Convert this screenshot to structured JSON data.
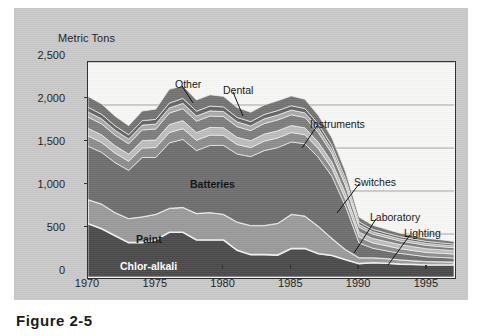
{
  "figure": {
    "caption": "Figure 2-5",
    "axis_title": "Metric Tons"
  },
  "chart_data": {
    "type": "area",
    "title": "",
    "subtitle": "",
    "xlabel": "",
    "ylabel": "Metric Tons",
    "ylim": [
      0,
      2500
    ],
    "xlim": [
      1970,
      1997
    ],
    "grid": true,
    "legend_position": "inline-annotations",
    "ytick_labels": [
      "2,500",
      "2,000",
      "1,500",
      "1,000",
      "500",
      "0"
    ],
    "ytick_values": [
      2500,
      2000,
      1500,
      1000,
      500,
      0
    ],
    "xtick_labels": [
      "1970",
      "1975",
      "1980",
      "1985",
      "1990",
      "1995"
    ],
    "xtick_values": [
      1970,
      1975,
      1980,
      1985,
      1990,
      1995
    ],
    "x": [
      1970,
      1971,
      1972,
      1973,
      1974,
      1975,
      1976,
      1977,
      1978,
      1979,
      1980,
      1981,
      1982,
      1983,
      1984,
      1985,
      1986,
      1987,
      1988,
      1989,
      1990,
      1991,
      1992,
      1993,
      1994,
      1995,
      1996,
      1997
    ],
    "stack_order_bottom_to_top": [
      "Chlor-alkali",
      "Paint",
      "Batteries",
      "Instruments",
      "Dental",
      "Switches",
      "Laboratory",
      "Lighting",
      "Other"
    ],
    "series": [
      {
        "name": "Chlor-alkali",
        "color": "#4a4a4a",
        "values": [
          620,
          560,
          480,
          400,
          400,
          430,
          520,
          520,
          430,
          430,
          430,
          310,
          260,
          260,
          255,
          330,
          330,
          270,
          250,
          200,
          155,
          165,
          160,
          150,
          145,
          140,
          140,
          140
        ]
      },
      {
        "name": "Paint",
        "color": "#9a9a9a",
        "values": [
          280,
          290,
          270,
          280,
          300,
          300,
          280,
          290,
          310,
          320,
          300,
          330,
          340,
          340,
          370,
          400,
          380,
          320,
          200,
          120,
          70,
          60,
          55,
          50,
          45,
          40,
          38,
          35
        ]
      },
      {
        "name": "Batteries",
        "color": "#6e6e6e",
        "values": [
          620,
          600,
          580,
          560,
          690,
          660,
          760,
          790,
          730,
          780,
          800,
          790,
          800,
          870,
          880,
          840,
          840,
          800,
          720,
          500,
          170,
          110,
          90,
          75,
          65,
          55,
          50,
          45
        ]
      },
      {
        "name": "Instruments",
        "color": "#8c8c8c",
        "values": [
          120,
          115,
          110,
          105,
          110,
          115,
          120,
          125,
          120,
          120,
          118,
          110,
          105,
          110,
          112,
          110,
          105,
          100,
          92,
          85,
          70,
          62,
          58,
          55,
          52,
          50,
          48,
          46
        ]
      },
      {
        "name": "Dental",
        "color": "#bcbcbc",
        "values": [
          90,
          88,
          86,
          84,
          86,
          88,
          92,
          94,
          90,
          90,
          88,
          84,
          80,
          82,
          84,
          82,
          80,
          76,
          72,
          66,
          56,
          52,
          50,
          48,
          46,
          44,
          42,
          40
        ]
      },
      {
        "name": "Switches",
        "color": "#7d7d7d",
        "values": [
          130,
          128,
          124,
          120,
          124,
          128,
          134,
          138,
          132,
          132,
          130,
          124,
          118,
          122,
          126,
          124,
          120,
          112,
          100,
          88,
          58,
          50,
          46,
          42,
          40,
          38,
          36,
          34
        ]
      },
      {
        "name": "Laboratory",
        "color": "#a8a8a8",
        "values": [
          60,
          58,
          56,
          55,
          56,
          58,
          60,
          62,
          60,
          60,
          58,
          56,
          54,
          55,
          56,
          55,
          54,
          52,
          48,
          44,
          32,
          28,
          26,
          25,
          24,
          23,
          22,
          21
        ]
      },
      {
        "name": "Lighting",
        "color": "#636363",
        "values": [
          55,
          54,
          52,
          50,
          52,
          54,
          56,
          58,
          56,
          56,
          54,
          52,
          50,
          51,
          52,
          51,
          50,
          48,
          44,
          40,
          30,
          27,
          26,
          25,
          24,
          23,
          22,
          21
        ]
      },
      {
        "name": "Other",
        "color": "#737373",
        "values": [
          125,
          120,
          112,
          106,
          112,
          119,
          160,
          145,
          130,
          130,
          122,
          114,
          108,
          110,
          115,
          113,
          108,
          100,
          90,
          80,
          55,
          48,
          44,
          40,
          38,
          36,
          34,
          32
        ]
      }
    ],
    "annotations": [
      {
        "label": "Other",
        "text_x": 161,
        "text_y": 70,
        "line": [
          168,
          78,
          179,
          95
        ]
      },
      {
        "label": "Dental",
        "text_x": 209,
        "text_y": 76,
        "line": [
          219,
          84,
          229,
          108
        ]
      },
      {
        "label": "Instruments",
        "text_x": 296,
        "text_y": 110,
        "line": [
          303,
          118,
          288,
          140
        ]
      },
      {
        "label": "Switches",
        "text_x": 340,
        "text_y": 168,
        "line": [
          345,
          176,
          323,
          205
        ]
      },
      {
        "label": "Laboratory",
        "text_x": 356,
        "text_y": 203,
        "line": [
          362,
          211,
          340,
          245
        ]
      },
      {
        "label": "Lighting",
        "text_x": 390,
        "text_y": 219,
        "line": [
          396,
          227,
          374,
          257
        ]
      },
      {
        "label": "Batteries",
        "text_x": 176,
        "text_y": 170,
        "style": "dark-bold"
      },
      {
        "label": "Paint",
        "text_x": 122,
        "text_y": 225,
        "style": "dark-bold"
      },
      {
        "label": "Chlor-alkali",
        "text_x": 106,
        "text_y": 252,
        "style": "light"
      }
    ]
  }
}
